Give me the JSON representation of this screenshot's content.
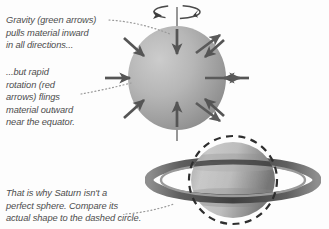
{
  "figure": {
    "background_color": "#fdfdfd"
  },
  "captions": {
    "gravity": "Gravity (green arrows)\npulls material inward\nin all directions...",
    "rotation": "...but rapid\nrotation (red\narrows) flings\nmaterial outward\nnear the equator.",
    "shape": "That is why Saturn isn't a\nperfect sphere. Compare its\nactual shape to the dashed circle."
  },
  "colors": {
    "text": "#4d4d4d",
    "gravity_arrow": "#555555",
    "rotation_arrow": "#5a5a5a",
    "sphere_light": "#c9c9c9",
    "sphere_dark": "#8e8e8e",
    "planet_light": "#cfcfcf",
    "planet_dark": "#7d7d7d",
    "ring": "#6f6f6f",
    "dashed_circle": "#2e2e2e",
    "leader_line": "#9a9a9a",
    "axis_line": "#7d7d7d"
  },
  "top_diagram": {
    "label": "rotating sphere with force arrows",
    "sphere": {
      "cx": 177,
      "cy": 78,
      "rx": 49,
      "ry": 52
    },
    "rotation_indicator": {
      "label": "spin-direction-ellipse",
      "cx": 177,
      "cy": 12,
      "rx": 24,
      "ry": 7
    },
    "rotation_axis": {
      "label": "rotation-axis",
      "x": 177,
      "y1": 8,
      "y2": 140
    },
    "gravity_arrows": {
      "label": "gravity-arrows-inward",
      "count": 8,
      "direction": "inward"
    },
    "rotation_arrows": {
      "label": "rotation-arrows-outward",
      "count": 3,
      "direction": "outward at equator"
    }
  },
  "bottom_diagram": {
    "label": "Saturn photograph with dashed reference circle",
    "planet": {
      "cx": 233,
      "cy": 180,
      "rx": 42,
      "ry": 38
    },
    "dashed_circle": {
      "cx": 233,
      "cy": 180,
      "r": 44
    },
    "rings": {
      "label": "saturn-rings",
      "outer_rx": 84,
      "outer_ry": 19
    }
  },
  "leaders": [
    {
      "name": "leader-gravity",
      "from": [
        108,
        20
      ],
      "to": [
        168,
        33
      ]
    },
    {
      "name": "leader-rotation",
      "from": [
        80,
        93
      ],
      "to": [
        133,
        82
      ]
    },
    {
      "name": "leader-dashed-circle",
      "from": [
        125,
        213
      ],
      "to": [
        172,
        202
      ]
    }
  ]
}
